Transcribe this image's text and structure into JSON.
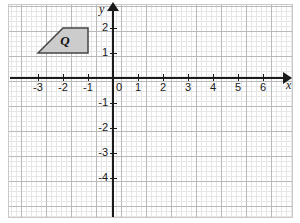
{
  "figure": {
    "kind": "cartesian-coordinate-plane",
    "background_color": "#ffffff",
    "grid": {
      "major_color": "#b9b9b9",
      "minor_color": "#e6e6e6",
      "major_spacing_units": 1,
      "minor_per_major": 5,
      "visible": true
    },
    "axes": {
      "color": "#1a1a1a",
      "x_label": "x",
      "y_label": "y",
      "origin_label": "0",
      "x_range": [
        -3.6,
        6.6
      ],
      "y_range": [
        -4.6,
        2.6
      ],
      "x_arrow": true,
      "y_arrow": true
    },
    "x_ticks": [
      {
        "value": -3,
        "label": "-3"
      },
      {
        "value": -2,
        "label": "-2"
      },
      {
        "value": -1,
        "label": "-1"
      },
      {
        "value": 1,
        "label": "1"
      },
      {
        "value": 2,
        "label": "2"
      },
      {
        "value": 3,
        "label": "3"
      },
      {
        "value": 4,
        "label": "4"
      },
      {
        "value": 5,
        "label": "5"
      },
      {
        "value": 6,
        "label": "6"
      }
    ],
    "y_ticks": [
      {
        "value": 2,
        "label": "2"
      },
      {
        "value": 1,
        "label": "1"
      },
      {
        "value": -1,
        "label": "-1"
      },
      {
        "value": -2,
        "label": "-2"
      },
      {
        "value": -3,
        "label": "-3"
      },
      {
        "value": -4,
        "label": "-4"
      }
    ],
    "shapes": [
      {
        "name": "Q",
        "label": "Q",
        "type": "trapezoid",
        "vertices": [
          {
            "x": -3,
            "y": 1
          },
          {
            "x": -2,
            "y": 2
          },
          {
            "x": -1,
            "y": 2
          },
          {
            "x": -1,
            "y": 1
          }
        ],
        "fill_color": "#cccccc",
        "stroke_color": "#444444",
        "label_position": {
          "x": -1.95,
          "y": 1.5
        }
      }
    ]
  }
}
